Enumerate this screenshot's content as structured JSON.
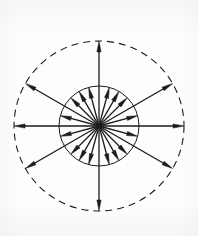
{
  "figure": {
    "background_color": "#fdfdfc",
    "ink_color": "#1b1b1b"
  },
  "chart_data": {
    "type": "scatter",
    "subtitle": "",
    "xlabel": "",
    "ylabel": "",
    "coordinate_system": "polar",
    "grid": false,
    "legend_position": "none",
    "axis_ranges": {
      "angle_deg": [
        0,
        360
      ],
      "radius": [
        0,
        85
      ]
    },
    "origin": {
      "x": 99,
      "y": 126,
      "label": "center"
    },
    "circles": [
      {
        "name": "outer-circle",
        "radius": 85,
        "stroke": "#1b1b1b",
        "stroke_width": 1.1,
        "style": "dashed",
        "dash_pattern": "7 5"
      },
      {
        "name": "inner-circle",
        "radius": 40,
        "stroke": "#1b1b1b",
        "stroke_width": 1.0,
        "style": "solid",
        "dash_pattern": ""
      }
    ],
    "series": [
      {
        "name": "long-vectors",
        "count": 8,
        "radius": 85,
        "marker": "arrowhead-outward",
        "stroke_width": 1.3,
        "values": [
          {
            "angle_deg": 90,
            "radius": 85,
            "label": "N"
          },
          {
            "angle_deg": 30,
            "radius": 85,
            "label": "NNE"
          },
          {
            "angle_deg": 0,
            "radius": 85,
            "label": "E"
          },
          {
            "angle_deg": 330,
            "radius": 85,
            "label": "SSE"
          },
          {
            "angle_deg": 270,
            "radius": 85,
            "label": "S"
          },
          {
            "angle_deg": 210,
            "radius": 85,
            "label": "SSW"
          },
          {
            "angle_deg": 180,
            "radius": 85,
            "label": "W"
          },
          {
            "angle_deg": 150,
            "radius": 85,
            "label": "NNW"
          }
        ]
      },
      {
        "name": "short-vectors",
        "count": 8,
        "radius": 40,
        "marker": "arrowhead-outward",
        "stroke_width": 1.3,
        "values": [
          {
            "angle_deg": 75,
            "radius": 40,
            "label": "r1"
          },
          {
            "angle_deg": 60,
            "radius": 40,
            "label": "r2"
          },
          {
            "angle_deg": 45,
            "radius": 40,
            "label": "r3"
          },
          {
            "angle_deg": 15,
            "radius": 40,
            "label": "r4"
          },
          {
            "angle_deg": 345,
            "radius": 40,
            "label": "r5"
          },
          {
            "angle_deg": 315,
            "radius": 40,
            "label": "r6"
          },
          {
            "angle_deg": 300,
            "radius": 40,
            "label": "r7"
          },
          {
            "angle_deg": 285,
            "radius": 40,
            "label": "r8"
          },
          {
            "angle_deg": 255,
            "radius": 40,
            "label": "r9"
          },
          {
            "angle_deg": 240,
            "radius": 40,
            "label": "r10"
          },
          {
            "angle_deg": 225,
            "radius": 40,
            "label": "r11"
          },
          {
            "angle_deg": 195,
            "radius": 40,
            "label": "r12"
          },
          {
            "angle_deg": 165,
            "radius": 40,
            "label": "r13"
          },
          {
            "angle_deg": 135,
            "radius": 40,
            "label": "r14"
          },
          {
            "angle_deg": 120,
            "radius": 40,
            "label": "r15"
          },
          {
            "angle_deg": 105,
            "radius": 40,
            "label": "r16"
          }
        ]
      }
    ],
    "annotations": []
  }
}
